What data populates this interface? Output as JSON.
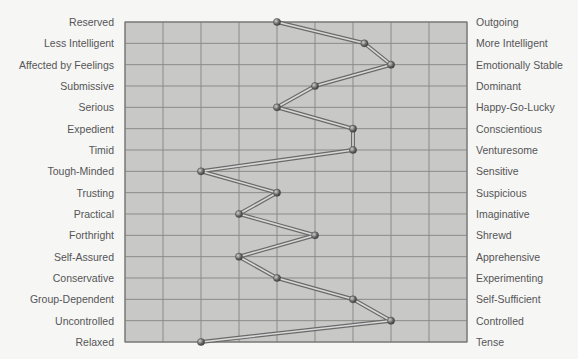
{
  "chart_data": {
    "type": "line",
    "title": "",
    "xlabel": "",
    "ylabel": "",
    "orientation": "horizontal-profile",
    "xlim": [
      1,
      10
    ],
    "x_ticks": [
      1,
      2,
      3,
      4,
      5,
      6,
      7,
      8,
      9,
      10
    ],
    "grid": true,
    "legend": null,
    "left_labels": [
      "Reserved",
      "Less Intelligent",
      "Affected by Feelings",
      "Submissive",
      "Serious",
      "Expedient",
      "Timid",
      "Tough-Minded",
      "Trusting",
      "Practical",
      "Forthright",
      "Self-Assured",
      "Conservative",
      "Group-Dependent",
      "Uncontrolled",
      "Relaxed"
    ],
    "right_labels": [
      "Outgoing",
      "More Intelligent",
      "Emotionally Stable",
      "Dominant",
      "Happy-Go-Lucky",
      "Conscientious",
      "Venturesome",
      "Sensitive",
      "Suspicious",
      "Imaginative",
      "Shrewd",
      "Apprehensive",
      "Experimenting",
      "Self-Sufficient",
      "Controlled",
      "Tense"
    ],
    "series": [
      {
        "name": "Profile",
        "values": [
          5,
          7.3,
          8,
          6,
          5,
          7,
          7,
          3,
          5,
          4,
          6,
          4,
          5,
          7,
          8,
          3
        ]
      }
    ]
  },
  "colors": {
    "background": "#f6f6f5",
    "plot_fill": "#c8c8c6",
    "grid_line": "#8a8a88",
    "border": "#6e6e6c",
    "text": "#555555",
    "line_outer": "#6a6a6a",
    "line_inner": "#d9d9d9",
    "marker": "#6f6f6f"
  }
}
